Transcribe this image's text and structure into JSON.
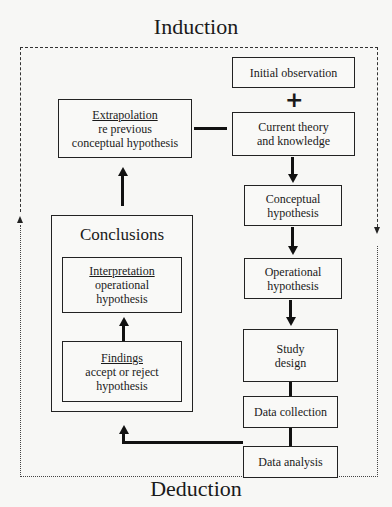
{
  "diagram": {
    "top_label": "Induction",
    "bottom_label": "Deduction",
    "right_column": [
      {
        "id": "initial-observation",
        "lines": [
          "Initial observation"
        ]
      },
      {
        "id": "current-theory",
        "lines": [
          "Current theory",
          "and knowledge"
        ]
      },
      {
        "id": "conceptual-hypothesis",
        "lines": [
          "Conceptual",
          "hypothesis"
        ]
      },
      {
        "id": "operational-hypothesis",
        "lines": [
          "Operational",
          "hypothesis"
        ]
      },
      {
        "id": "study-design",
        "lines": [
          "Study",
          "design"
        ]
      },
      {
        "id": "data-collection",
        "lines": [
          "Data collection"
        ]
      },
      {
        "id": "data-analysis",
        "lines": [
          "Data analysis"
        ]
      }
    ],
    "left_column": {
      "extrapolation": {
        "heading": "Extrapolation",
        "lines": [
          "re previous",
          "conceptual hypothesis"
        ]
      },
      "conclusions": {
        "title": "Conclusions",
        "interpretation": {
          "heading": "Interpretation",
          "lines": [
            "operational",
            "hypothesis"
          ]
        },
        "findings": {
          "heading": "Findings",
          "lines": [
            "accept or reject",
            "hypothesis"
          ]
        }
      }
    },
    "connectors": {
      "plus_symbol": "+",
      "minus_connector": "extrapolation-to-current-theory"
    }
  }
}
